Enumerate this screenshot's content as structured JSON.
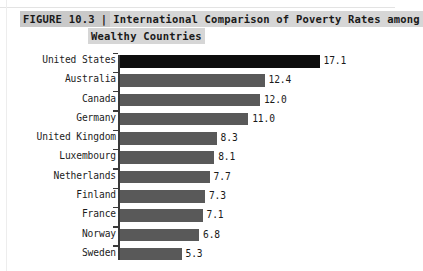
{
  "figure": {
    "label": "FIGURE 10.3",
    "separator": "|",
    "title_line_1": "International Comparison of Poverty Rates among",
    "title_line_2": "Wealthy Countries"
  },
  "colors": {
    "bar": "#595959",
    "bar_highlight": "#0d0d0d",
    "title_band": "#c9c9c9",
    "axis": "#3a3a3a",
    "background": "#ffffff"
  },
  "chart_data": {
    "type": "bar",
    "orientation": "horizontal",
    "title": "International Comparison of Poverty Rates among Wealthy Countries",
    "xlabel": "",
    "ylabel": "",
    "xlim": [
      0,
      17.1
    ],
    "grid": false,
    "legend": "none",
    "highlight_category": "United States",
    "categories": [
      "United States",
      "Australia",
      "Canada",
      "Germany",
      "United Kingdom",
      "Luxembourg",
      "Netherlands",
      "Finland",
      "France",
      "Norway",
      "Sweden"
    ],
    "values": [
      17.1,
      12.4,
      12.0,
      11.0,
      8.3,
      8.1,
      7.7,
      7.3,
      7.1,
      6.8,
      5.3
    ],
    "value_labels": [
      "17.1",
      "12.4",
      "12.0",
      "11.0",
      "8.3",
      "8.1",
      "7.7",
      "7.3",
      "7.1",
      "6.8",
      "5.3"
    ],
    "rows": [
      {
        "label": "United States",
        "value": 17.1,
        "value_label": "17.1",
        "highlight": true
      },
      {
        "label": "Australia",
        "value": 12.4,
        "value_label": "12.4",
        "highlight": false
      },
      {
        "label": "Canada",
        "value": 12.0,
        "value_label": "12.0",
        "highlight": false
      },
      {
        "label": "Germany",
        "value": 11.0,
        "value_label": "11.0",
        "highlight": false
      },
      {
        "label": "United Kingdom",
        "value": 8.3,
        "value_label": "8.3",
        "highlight": false
      },
      {
        "label": "Luxembourg",
        "value": 8.1,
        "value_label": "8.1",
        "highlight": false
      },
      {
        "label": "Netherlands",
        "value": 7.7,
        "value_label": "7.7",
        "highlight": false
      },
      {
        "label": "Finland",
        "value": 7.3,
        "value_label": "7.3",
        "highlight": false
      },
      {
        "label": "France",
        "value": 7.1,
        "value_label": "7.1",
        "highlight": false
      },
      {
        "label": "Norway",
        "value": 6.8,
        "value_label": "6.8",
        "highlight": false
      },
      {
        "label": "Sweden",
        "value": 5.3,
        "value_label": "5.3",
        "highlight": false
      }
    ]
  }
}
